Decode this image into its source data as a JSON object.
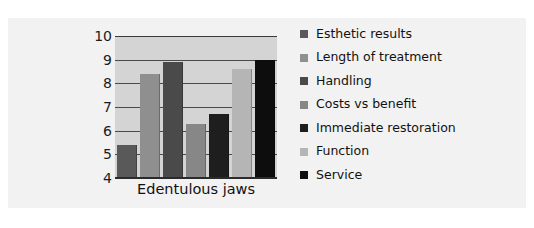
{
  "chart_data": {
    "type": "bar",
    "title": "",
    "subtitle": "",
    "xlabel": "",
    "ylabel": "",
    "categories": [
      "Edentulous jaws"
    ],
    "ylim": [
      4,
      10
    ],
    "yticks": [
      4,
      5,
      6,
      7,
      8,
      9,
      10
    ],
    "ytick_labels": [
      "4",
      "5",
      "6",
      "7",
      "8",
      "9",
      "10"
    ],
    "grid": true,
    "legend_position": "right",
    "series": [
      {
        "name": "Esthetic results",
        "values": [
          5.4
        ],
        "color": "#595959"
      },
      {
        "name": "Length of treatment",
        "values": [
          8.4
        ],
        "color": "#8f8f8f"
      },
      {
        "name": "Handling",
        "values": [
          8.9
        ],
        "color": "#4a4a4a"
      },
      {
        "name": "Costs vs benefit",
        "values": [
          6.3
        ],
        "color": "#878787"
      },
      {
        "name": "Immediate restoration",
        "values": [
          6.7
        ],
        "color": "#1e1e1e"
      },
      {
        "name": "Function",
        "values": [
          8.6
        ],
        "color": "#b5b5b5"
      },
      {
        "name": "Service",
        "values": [
          9.0
        ],
        "color": "#0d0d0d"
      }
    ]
  },
  "legend": {
    "items": [
      {
        "label": "Esthetic results",
        "swatch": "#595959"
      },
      {
        "label": "Length of treatment",
        "swatch": "#8f8f8f"
      },
      {
        "label": "Handling",
        "swatch": "#4a4a4a"
      },
      {
        "label": "Costs vs benefit",
        "swatch": "#878787"
      },
      {
        "label": "Immediate restoration",
        "swatch": "#1e1e1e"
      },
      {
        "label": "Function",
        "swatch": "#b5b5b5"
      },
      {
        "label": "Service",
        "swatch": "#0d0d0d"
      }
    ]
  },
  "axis": {
    "category_label": "Edentulous jaws"
  },
  "colors": {
    "page_background": "#ffffff",
    "card_background": "#f2f2f2",
    "plot_background": "#d4d4d4",
    "gridline": "#4a4a4a",
    "text": "#111111"
  }
}
